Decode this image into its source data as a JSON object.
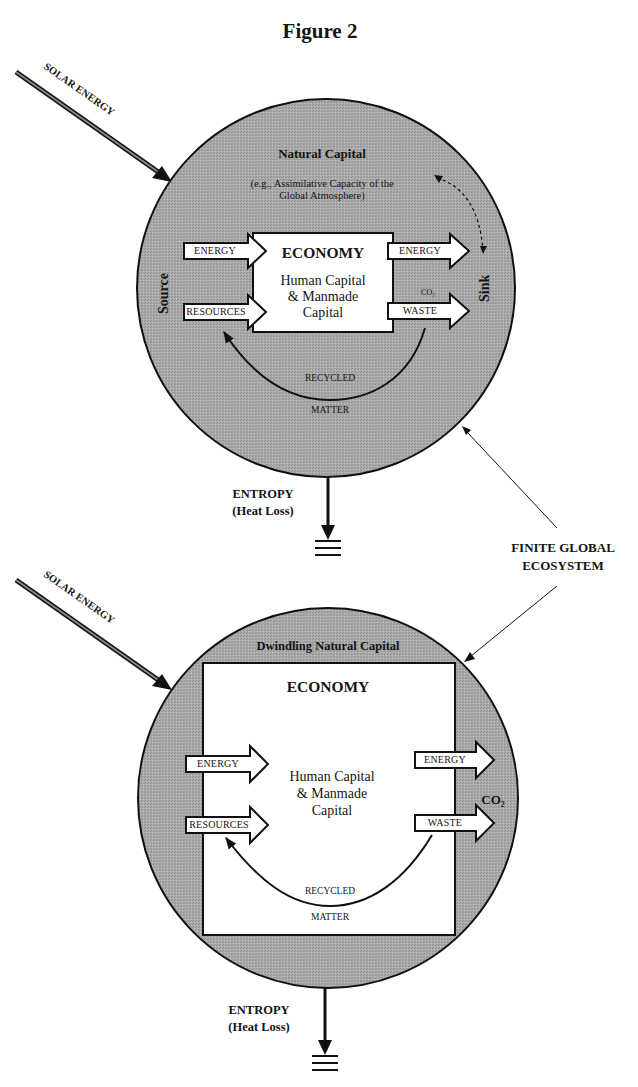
{
  "figure": {
    "title": "Figure 2"
  },
  "colors": {
    "circle_fill": "#a9a9a9",
    "stroke": "#111111",
    "box_fill": "#ffffff",
    "background": "#ffffff"
  },
  "top_diagram": {
    "solar_label": "SOLAR ENERGY",
    "natural_capital_title": "Natural Capital",
    "natural_capital_note_line1": "(e.g., Assimilative Capacity of the",
    "natural_capital_note_line2": "Global Atmosphere)",
    "source_label": "Source",
    "sink_label": "Sink",
    "economy_title": "ECONOMY",
    "economy_line1": "Human Capital",
    "economy_line2": "& Manmade",
    "economy_line3": "Capital",
    "input_energy": "ENERGY",
    "input_resources": "RESOURCES",
    "output_energy": "ENERGY",
    "output_waste": "WASTE",
    "co2_label": "CO₂",
    "recycled_line1": "RECYCLED",
    "recycled_line2": "MATTER",
    "entropy_line1": "ENTROPY",
    "entropy_line2": "(Heat Loss)"
  },
  "shared": {
    "finite_line1": "FINITE GLOBAL",
    "finite_line2": "ECOSYSTEM"
  },
  "bottom_diagram": {
    "solar_label": "SOLAR ENERGY",
    "natural_capital_title": "Dwindling Natural Capital",
    "economy_title": "ECONOMY",
    "economy_line1": "Human Capital",
    "economy_line2": "& Manmade",
    "economy_line3": "Capital",
    "input_energy": "ENERGY",
    "input_resources": "RESOURCES",
    "output_energy": "ENERGY",
    "output_waste": "WASTE",
    "co2_label": "CO₂",
    "recycled_line1": "RECYCLED",
    "recycled_line2": "MATTER",
    "entropy_line1": "ENTROPY",
    "entropy_line2": "(Heat Loss)"
  }
}
